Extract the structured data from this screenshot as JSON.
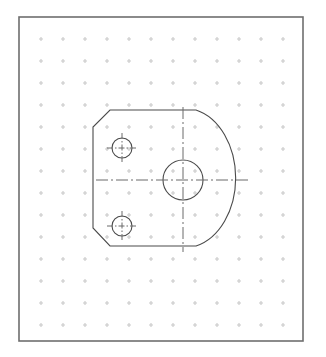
{
  "canvas": {
    "width": 326,
    "height": 357,
    "background_color": "#ffffff",
    "title": "CAD Drawing Area"
  },
  "border": {
    "name": "drawing-frame",
    "x": 19,
    "y": 17,
    "width": 284,
    "height": 324,
    "stroke_color": "#6e6e6e",
    "stroke_width": 1.6
  },
  "grid": {
    "name": "snap-grid",
    "visible": true,
    "style": "dots",
    "spacing": 22,
    "origin_x": 41,
    "origin_y": 39,
    "dot_color": "#c9c9c9",
    "dot_size": 1.1,
    "cross_arm": 2
  },
  "geometry": {
    "part_outline": {
      "name": "part-outline",
      "stroke_color": "#4a4a4a",
      "stroke_width": 1.1,
      "line_type": "continuous",
      "description": "D-shaped bracket plate with chamfered left corners and large right radius",
      "vertices": {
        "top_left_chamfer_start": [
          110,
          110
        ],
        "top_right": [
          196,
          110
        ],
        "left_top": [
          93,
          127
        ],
        "left_bottom": [
          93,
          228
        ],
        "bottom_left_chamfer_end": [
          110,
          246
        ],
        "bottom_right": [
          196,
          246
        ],
        "arc_rightmost": [
          235,
          180
        ]
      },
      "arc": {
        "center_x": 183,
        "center_y": 180,
        "radius_x": 52,
        "radius_y": 70,
        "sweep": "right side, from top edge end to bottom edge end"
      }
    },
    "holes": [
      {
        "name": "center-bore",
        "cx": 183,
        "cy": 180,
        "r": 20,
        "stroke_color": "#4a4a4a",
        "stroke_width": 1.1,
        "label": "large center hole"
      },
      {
        "name": "upper-left-hole",
        "cx": 122,
        "cy": 148,
        "r": 10,
        "stroke_color": "#4a4a4a",
        "stroke_width": 1.1,
        "label": "small mounting hole upper"
      },
      {
        "name": "lower-left-hole",
        "cx": 122,
        "cy": 226,
        "r": 10,
        "stroke_color": "#4a4a4a",
        "stroke_width": 1.1,
        "label": "small mounting hole lower"
      }
    ],
    "centerlines": [
      {
        "name": "main-horizontal-centerline",
        "orientation": "horizontal",
        "x1": 96,
        "y1": 180,
        "x2": 250,
        "y2": 180,
        "stroke_color": "#6a6a6a",
        "stroke_width": 1.0,
        "line_type": "dash-dot",
        "dash_pattern": "12 3 2 3"
      },
      {
        "name": "main-vertical-centerline",
        "orientation": "vertical",
        "x1": 183,
        "y1": 107,
        "x2": 183,
        "y2": 252,
        "stroke_color": "#6a6a6a",
        "stroke_width": 1.0,
        "line_type": "dash-dot",
        "dash_pattern": "12 3 2 3"
      },
      {
        "name": "upper-hole-horizontal-centermark",
        "orientation": "horizontal",
        "x1": 107,
        "y1": 148,
        "x2": 137,
        "y2": 148,
        "stroke_color": "#6a6a6a",
        "stroke_width": 1.0,
        "line_type": "dash-dot",
        "dash_pattern": "6 2 1.5 2"
      },
      {
        "name": "upper-hole-vertical-centermark",
        "orientation": "vertical",
        "x1": 122,
        "y1": 133,
        "x2": 122,
        "y2": 163,
        "stroke_color": "#6a6a6a",
        "stroke_width": 1.0,
        "line_type": "dash-dot",
        "dash_pattern": "6 2 1.5 2"
      },
      {
        "name": "lower-hole-horizontal-centermark",
        "orientation": "horizontal",
        "x1": 107,
        "y1": 226,
        "x2": 137,
        "y2": 226,
        "stroke_color": "#6a6a6a",
        "stroke_width": 1.0,
        "line_type": "dash-dot",
        "dash_pattern": "6 2 1.5 2"
      },
      {
        "name": "lower-hole-vertical-centermark",
        "orientation": "vertical",
        "x1": 122,
        "y1": 211,
        "x2": 122,
        "y2": 241,
        "stroke_color": "#6a6a6a",
        "stroke_width": 1.0,
        "line_type": "dash-dot",
        "dash_pattern": "6 2 1.5 2"
      }
    ]
  },
  "colors": {
    "frame": "#6e6e6e",
    "geometry": "#4a4a4a",
    "centerline": "#6a6a6a",
    "grid_dot": "#c9c9c9",
    "background": "#ffffff"
  }
}
